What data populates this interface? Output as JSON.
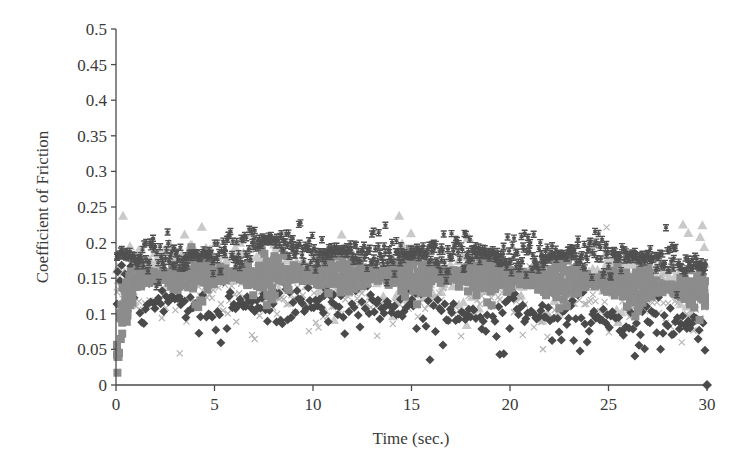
{
  "chart_data": {
    "type": "scatter",
    "title": "",
    "xlabel": "Time (sec.)",
    "ylabel": "Coefficient of Friction",
    "xlim": [
      0,
      30
    ],
    "ylim": [
      0,
      0.5
    ],
    "x_ticks": [
      0,
      5,
      10,
      15,
      20,
      25,
      30
    ],
    "x_tick_labels": [
      "0",
      "5",
      "10",
      "15",
      "20",
      "25",
      "30"
    ],
    "y_ticks": [
      0,
      0.05,
      0.1,
      0.15,
      0.2,
      0.25,
      0.3,
      0.35,
      0.4,
      0.45,
      0.5
    ],
    "y_tick_labels": [
      "0",
      "0.05",
      "0.1",
      "0.15",
      "0.2",
      "0.25",
      "0.3",
      "0.35",
      "0.4",
      "0.45",
      "0.5"
    ],
    "grid": false,
    "legend": null,
    "series": [
      {
        "name": "Series 1 (diamond)",
        "marker": "diamond",
        "color": "#4a4a4a",
        "trend_x": [
          0,
          2,
          5,
          10,
          15,
          20,
          25,
          30
        ],
        "trend_y": [
          0.13,
          0.12,
          0.115,
          0.11,
          0.105,
          0.1,
          0.09,
          0.085
        ],
        "spread": 0.03,
        "points": 320
      },
      {
        "name": "Series 2 (square)",
        "marker": "square",
        "color": "#8c8c8c",
        "trend_x": [
          0,
          0.3,
          1,
          5,
          10,
          15,
          20,
          25,
          30
        ],
        "trend_y": [
          0.03,
          0.1,
          0.15,
          0.155,
          0.155,
          0.155,
          0.15,
          0.145,
          0.13
        ],
        "spread": 0.018,
        "points": 1300
      },
      {
        "name": "Series 3 (triangle)",
        "marker": "triangle",
        "color": "#c9c9c9",
        "trend_x": [
          0,
          2,
          5,
          10,
          15,
          20,
          25,
          30
        ],
        "trend_y": [
          0.16,
          0.17,
          0.175,
          0.16,
          0.15,
          0.145,
          0.15,
          0.165
        ],
        "spread": 0.035,
        "points": 420
      },
      {
        "name": "Series 4 (x-mark)",
        "marker": "x",
        "color": "#b5b5b5",
        "trend_x": [
          0,
          2,
          5,
          10,
          15,
          20,
          25,
          30
        ],
        "trend_y": [
          0.12,
          0.12,
          0.125,
          0.12,
          0.12,
          0.13,
          0.12,
          0.12
        ],
        "spread": 0.035,
        "points": 260
      },
      {
        "name": "Series 5 (bar-star)",
        "marker": "istar",
        "color": "#505050",
        "trend_x": [
          0,
          1,
          5,
          7,
          8,
          10,
          15,
          20,
          25,
          30
        ],
        "trend_y": [
          0.185,
          0.18,
          0.18,
          0.2,
          0.205,
          0.19,
          0.185,
          0.185,
          0.185,
          0.165
        ],
        "spread": 0.018,
        "points": 620
      }
    ],
    "annotations": [],
    "observed_range": {
      "min_approx": 0.01,
      "max_approx": 0.26,
      "band_center_approx": 0.15
    }
  }
}
